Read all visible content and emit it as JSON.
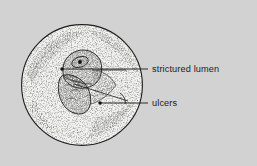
{
  "figure": {
    "kind": "endoscopic-view-illustration",
    "caption_labels": [
      "strictured lumen",
      "ulcers"
    ],
    "background_color": "#d2d2d2",
    "ink_color": "#1c1c1c",
    "stipple_color": "#2a2a2a",
    "field_fill": "#f2f2f0"
  },
  "view_field": {
    "shape": "circle",
    "center_x": 82,
    "center_y": 85,
    "radius": 61,
    "stroke_color": "#1c1c1c",
    "stroke_width": 1.1
  },
  "annotations": [
    {
      "id": "strictured-lumen",
      "label": "strictured lumen",
      "text_x": 152,
      "text_y": 72,
      "marker_x": 62,
      "marker_y": 69,
      "leader_path": "M62,69 L148,69",
      "marker_radius": 1.7
    },
    {
      "id": "ulcers",
      "label": "ulcers",
      "text_x": 152,
      "text_y": 106,
      "marker_x": 100,
      "marker_y": 103,
      "leader_path": "M100,103 L148,103",
      "marker_radius": 1.7
    }
  ],
  "lesion": {
    "name": "strictured lumen mass",
    "description": "shaded irregular mass at centre of field with ulcerated surface"
  }
}
